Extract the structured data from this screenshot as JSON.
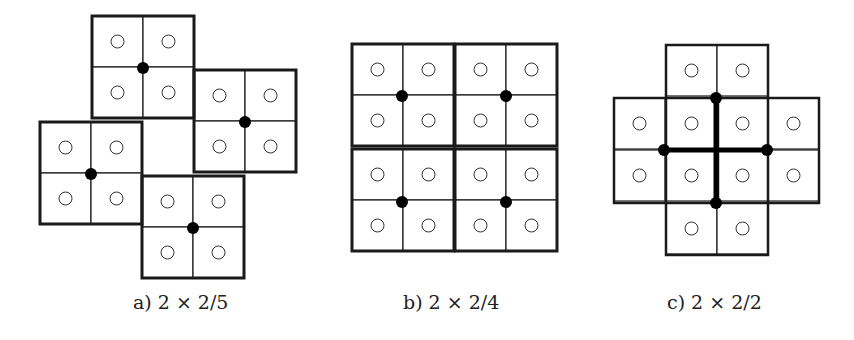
{
  "figures": [
    {
      "id": "a",
      "caption": "a) 2 × 2/5",
      "cell_size": 51,
      "blocks": [
        {
          "x": 92,
          "y": 16
        },
        {
          "x": 194,
          "y": 70
        },
        {
          "x": 40,
          "y": 122
        },
        {
          "x": 142,
          "y": 176
        }
      ],
      "dots": [
        {
          "x": 143,
          "y": 68
        },
        {
          "x": 245,
          "y": 122
        },
        {
          "x": 91,
          "y": 174
        },
        {
          "x": 193,
          "y": 228
        }
      ],
      "thick_lines": []
    },
    {
      "id": "b",
      "caption": "b) 2 × 2/4",
      "cell_size": 51,
      "blocks": [
        {
          "x": 352,
          "y": 44
        },
        {
          "x": 455,
          "y": 44
        },
        {
          "x": 352,
          "y": 149
        },
        {
          "x": 455,
          "y": 149
        }
      ],
      "dots": [
        {
          "x": 402,
          "y": 96
        },
        {
          "x": 506,
          "y": 96
        },
        {
          "x": 402,
          "y": 202
        },
        {
          "x": 506,
          "y": 202
        }
      ],
      "thick_lines": []
    },
    {
      "id": "c",
      "caption": "c) 2 × 2/2",
      "cell_size": 51,
      "blocks": [],
      "outline_cells": [
        {
          "x": 666,
          "y": 45
        },
        {
          "x": 717,
          "y": 45
        },
        {
          "x": 614,
          "y": 98
        },
        {
          "x": 666,
          "y": 98
        },
        {
          "x": 717,
          "y": 98
        },
        {
          "x": 768,
          "y": 98
        },
        {
          "x": 614,
          "y": 150
        },
        {
          "x": 666,
          "y": 150
        },
        {
          "x": 717,
          "y": 150
        },
        {
          "x": 768,
          "y": 150
        },
        {
          "x": 666,
          "y": 203
        },
        {
          "x": 717,
          "y": 203
        }
      ],
      "block_outlines": [
        {
          "x": 666,
          "y": 45,
          "w": 102,
          "h": 105
        },
        {
          "x": 614,
          "y": 98,
          "w": 104,
          "h": 105
        },
        {
          "x": 717,
          "y": 98,
          "w": 102,
          "h": 105
        },
        {
          "x": 666,
          "y": 150,
          "w": 102,
          "h": 105
        }
      ],
      "dots": [
        {
          "x": 716,
          "y": 98
        },
        {
          "x": 664,
          "y": 150
        },
        {
          "x": 767,
          "y": 150
        },
        {
          "x": 716,
          "y": 203
        }
      ],
      "thick_lines": [
        {
          "x1": 716,
          "y1": 98,
          "x2": 716,
          "y2": 203
        },
        {
          "x1": 664,
          "y1": 150,
          "x2": 767,
          "y2": 150
        }
      ]
    }
  ],
  "style": {
    "line_color": "#1a1a1a",
    "thin_width": 1.2,
    "thick_width": 3,
    "circle_radius": 6.5,
    "dot_radius": 6
  }
}
